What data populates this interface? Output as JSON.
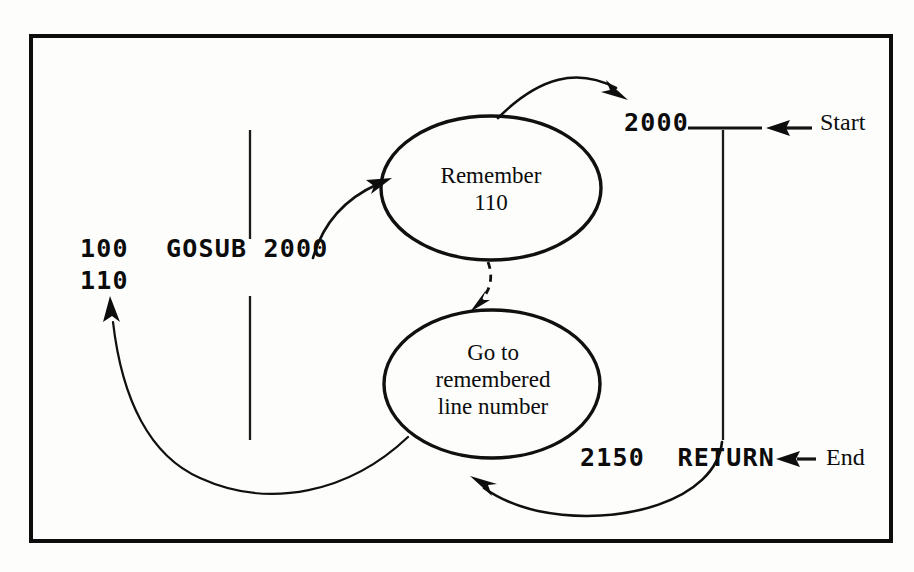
{
  "figure": {
    "type": "flowchart",
    "background_color": "#fdfdfc",
    "ink_color": "#0d0d0d",
    "frame": {
      "x": 29,
      "y": 34,
      "width": 864,
      "height": 509
    }
  },
  "program_lines": {
    "line_100": "100",
    "line_100_statement": "GOSUB 2000",
    "line_110": "110",
    "line_2000": "2000",
    "line_2150": "2150",
    "line_2150_statement": "RETURN"
  },
  "markers": {
    "start_label": "Start",
    "end_label": "End"
  },
  "nodes": [
    {
      "id": "remember",
      "shape": "ellipse",
      "text": "Remember\n110",
      "cx": 491,
      "cy": 188,
      "rx": 110,
      "ry": 72
    },
    {
      "id": "goto-remembered",
      "shape": "ellipse",
      "text": "Go to\nremembered\nline number",
      "cx": 492,
      "cy": 384,
      "rx": 108,
      "ry": 74
    }
  ],
  "edges": [
    {
      "id": "gosub-to-remember",
      "from": "GOSUB 2000",
      "to": "Remember 110",
      "style": "solid-curve"
    },
    {
      "id": "remember-to-2000",
      "from": "Remember 110",
      "to": "2000",
      "style": "solid-curve"
    },
    {
      "id": "remember-to-goto",
      "from": "Remember 110",
      "to": "Go to remembered line number",
      "style": "dashed-curve"
    },
    {
      "id": "return-to-goto",
      "from": "2150 RETURN",
      "to": "Go to remembered line number",
      "style": "solid-curve"
    },
    {
      "id": "goto-to-110",
      "from": "Go to remembered line number",
      "to": "110",
      "style": "solid-curve"
    }
  ],
  "rules": {
    "left_divider_upper": {
      "x": 250,
      "y1": 130,
      "y2": 239
    },
    "left_divider_lower": {
      "x": 250,
      "y1": 296,
      "y2": 440
    },
    "right_divider": {
      "x": 723,
      "y1": 130,
      "y2": 440
    },
    "start_tick": {
      "x1": 690,
      "x2": 760,
      "y": 128
    }
  }
}
